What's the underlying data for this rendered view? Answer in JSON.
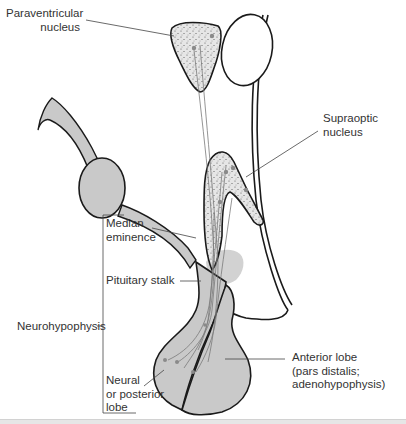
{
  "diagram": {
    "colors": {
      "fill_gray": "#c9c9c9",
      "stipple_fill": "#e4e4e4",
      "outline": "#1a1a1a",
      "leader_line": "#444444",
      "dot": "#8a8a8a",
      "text": "#333333"
    },
    "labels": {
      "paraventricular": "Paraventricular\nnucleus",
      "supraoptic": "Supraoptic\nnucleus",
      "median_eminence": "Median\neminence",
      "pituitary_stalk": "Pituitary stalk",
      "neurohypophysis": "Neurohypophysis",
      "neural_lobe": "Neural\nor posterior\nlobe",
      "anterior_lobe": "Anterior lobe\n(pars distalis;\nadenohypophysis)"
    }
  }
}
